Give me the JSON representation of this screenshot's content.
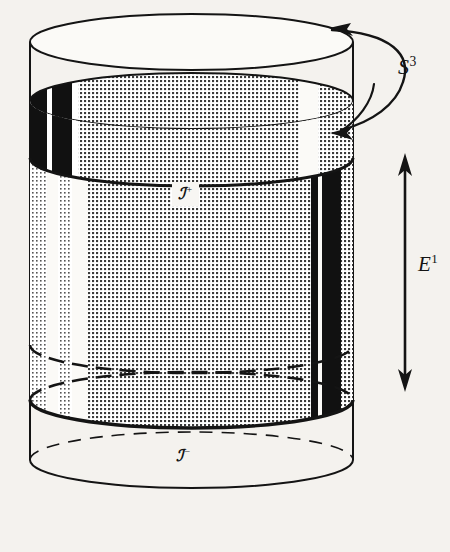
{
  "figure": {
    "background_color": "#f4f2ee",
    "ink_color": "#141414",
    "shade_color": "#8d8d8d",
    "black_band_color": "#111111"
  },
  "labels": {
    "s3": {
      "text": "S",
      "sup": "3",
      "name": "three-sphere"
    },
    "e1": {
      "text": "E",
      "sup": "1",
      "name": "time-axis"
    },
    "scri_plus": {
      "text": "ℐ",
      "sup": "+",
      "name": "future-null-infinity"
    },
    "scri_minus": {
      "text": "ℐ",
      "sup": "−",
      "name": "past-null-infinity"
    }
  },
  "geometry": {
    "cylinder": {
      "left_x": 30,
      "right_x": 353,
      "center_x": 191.5,
      "radius_x": 161.5,
      "radius_y": 28,
      "top_rim_y": 42,
      "bottom_rim_y": 460
    },
    "ellipses": [
      {
        "name": "top-rim",
        "cy": 42,
        "style": "solid-full"
      },
      {
        "name": "scri-plus-back",
        "cy": 101,
        "style": "solid-back"
      },
      {
        "name": "scri-plus-front",
        "cy": 158,
        "style": "solid-front"
      },
      {
        "name": "scri-minus-back",
        "cy": 345,
        "style": "dashed-back"
      },
      {
        "name": "scri-minus-front",
        "cy": 400,
        "style": "dashed-front"
      },
      {
        "name": "shade-bottom",
        "cy": 400,
        "style": "solid-front-heavy"
      },
      {
        "name": "bottom-rim",
        "cy": 460,
        "style": "solid-front"
      }
    ],
    "bands": [
      {
        "name": "band-shade-a",
        "x0": 30,
        "x1": 47,
        "fill": "dots"
      },
      {
        "name": "band-white-a",
        "x0": 47,
        "x1": 58,
        "fill": "white"
      },
      {
        "name": "band-shade-b",
        "x0": 58,
        "x1": 72,
        "fill": "dots"
      },
      {
        "name": "band-white-b",
        "x0": 72,
        "x1": 88,
        "fill": "white"
      },
      {
        "name": "band-shade-c",
        "x0": 88,
        "x1": 300,
        "fill": "dots"
      },
      {
        "name": "band-black-a",
        "x0": 300,
        "x1": 311,
        "fill": "dots"
      },
      {
        "name": "band-black-b",
        "x0": 311,
        "x1": 318,
        "fill": "black"
      },
      {
        "name": "band-white-c",
        "x0": 318,
        "x1": 322,
        "fill": "white"
      },
      {
        "name": "band-black-c",
        "x0": 322,
        "x1": 341,
        "fill": "black"
      },
      {
        "name": "band-shade-d",
        "x0": 341,
        "x1": 353,
        "fill": "dots"
      }
    ],
    "top_bands": [
      {
        "name": "top-black-a",
        "x0": 30,
        "x1": 47,
        "fill": "black"
      },
      {
        "name": "top-white-a",
        "x0": 47,
        "x1": 52,
        "fill": "white"
      },
      {
        "name": "top-black-b",
        "x0": 52,
        "x1": 72,
        "fill": "black"
      },
      {
        "name": "top-white-b",
        "x0": 72,
        "x1": 78,
        "fill": "white"
      },
      {
        "name": "top-shade-a",
        "x0": 78,
        "x1": 300,
        "fill": "dots"
      },
      {
        "name": "top-white-c",
        "x0": 300,
        "x1": 318,
        "fill": "white"
      },
      {
        "name": "top-shade-b",
        "x0": 318,
        "x1": 353,
        "fill": "dots"
      }
    ],
    "arrows": {
      "s3_arc": {
        "name": "rotation-arrow",
        "direction": "counterclockwise",
        "head_at": [
          332,
          28
        ]
      },
      "s3_tail_head": {
        "name": "rotation-arrow-inner-head",
        "head_at": [
          334,
          131
        ]
      },
      "e1_axis": {
        "name": "time-axis-arrow",
        "x": 405,
        "y_top": 157,
        "y_bottom": 388,
        "double_headed": true
      }
    }
  }
}
